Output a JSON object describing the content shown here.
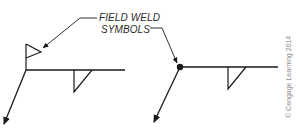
{
  "diagram": {
    "callout": {
      "line1": "FIELD WELD",
      "line2": "SYMBOLS"
    },
    "copyright": "© Cengage Learning 2014",
    "figures": [
      {
        "name": "flag-field-weld-symbol",
        "description": "Weld symbol with flag (field weld) at arrow/reference junction and fillet weld below reference line"
      },
      {
        "name": "dot-field-weld-symbol",
        "description": "Weld symbol with filled dot at arrow/reference junction and fillet weld below reference line"
      }
    ],
    "colors": {
      "line": "#1a1a1a",
      "text": "#2a2a2a",
      "copyright": "#8a8a8a",
      "background": "#ffffff"
    }
  }
}
